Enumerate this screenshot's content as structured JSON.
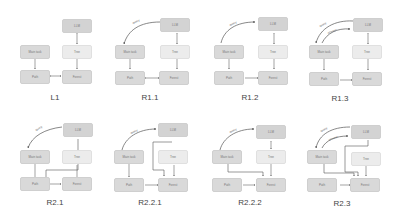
{
  "nodes": {
    "llm": "LLM",
    "main_task": "Main task",
    "tree": "Tree",
    "path": "Path",
    "forest": "Forest"
  },
  "edge_labels": {
    "r11": "query",
    "r12": "query",
    "r13_a": "query",
    "r13_b": "answer",
    "r21": "query",
    "r221": "query",
    "r222": "query",
    "r23_a": "query",
    "r23_b": "answer"
  },
  "panels": [
    {
      "id": "L1",
      "caption": "L1"
    },
    {
      "id": "R1.1",
      "caption": "R1.1"
    },
    {
      "id": "R1.2",
      "caption": "R1.2"
    },
    {
      "id": "R1.3",
      "caption": "R1.3"
    },
    {
      "id": "R2.1",
      "caption": "R2.1"
    },
    {
      "id": "R2.2.1",
      "caption": "R2.2.1"
    },
    {
      "id": "R2.2.2",
      "caption": "R2.2.2"
    },
    {
      "id": "R2.3",
      "caption": "R2.3"
    }
  ],
  "colors": {
    "node_fill": "#d9d9d9",
    "node_fill_light": "#ececec",
    "arrow": "#555555"
  }
}
